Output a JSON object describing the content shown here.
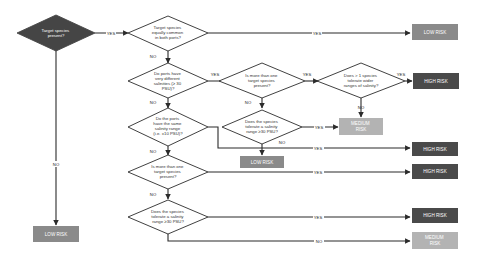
{
  "colors": {
    "low_risk": "#8a8a8a",
    "high_risk": "#4a4a4a",
    "medium_risk": "#b3b3b3",
    "start_diamond": "#454545",
    "line": "#2b2b2b"
  },
  "decisions": {
    "d1": [
      "Target species",
      "present?"
    ],
    "d2": [
      "Target species",
      "equally common",
      "in both ports?"
    ],
    "d3": [
      "Do ports have",
      "very different",
      "salinities (≥ 30",
      "PSU)?"
    ],
    "d4": [
      "Is more than one",
      "target species",
      "present?"
    ],
    "d5": [
      "Does > 1 species",
      "tolerate wider",
      "ranges of salinity?"
    ],
    "d6": [
      "Do the ports",
      "have the same",
      "salinity range",
      "(i.e. ±10 PSU)?"
    ],
    "d7": [
      "Does the species",
      "tolerate a salinity",
      "range ≥30 PSU?"
    ],
    "d8": [
      "Is more than one",
      "target species",
      "present?"
    ],
    "d9": [
      "Does the species",
      "tolerate a salinity",
      "range ≥30 PSU?"
    ]
  },
  "outcomes": {
    "o_low_top": [
      "LOW RISK"
    ],
    "o_high_1": [
      "HIGH RISK"
    ],
    "o_medium_1": [
      "MEDIUM",
      "RISK"
    ],
    "o_low_mid": [
      "LOW RISK"
    ],
    "o_high_2": [
      "HIGH RISK"
    ],
    "o_high_3": [
      "HIGH RISK"
    ],
    "o_high_4": [
      "HIGH RISK"
    ],
    "o_medium_2": [
      "MEDIUM",
      "RISK"
    ],
    "o_low_left": [
      "LOW RISK"
    ]
  },
  "edge_labels": {
    "yes": "YES",
    "no": "NO"
  }
}
